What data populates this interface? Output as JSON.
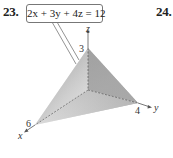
{
  "problems": [
    {
      "number": "23.",
      "equation": "2x + 3y + 4z = 12"
    },
    {
      "number": "24."
    }
  ],
  "figure": {
    "type": "3d-plane-intercepts",
    "axes": {
      "x_label": "x",
      "y_label": "y",
      "z_label": "z"
    },
    "intercepts": {
      "x": "6",
      "y": "4",
      "z": "3"
    },
    "colors": {
      "face_front": "#c8c8c8",
      "face_back": "#7a7a7a",
      "axis": "#555555"
    }
  }
}
